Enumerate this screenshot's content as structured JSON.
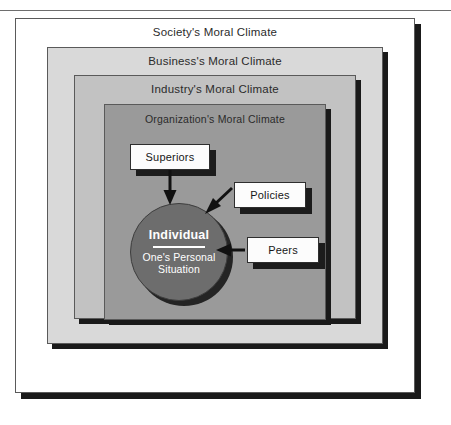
{
  "figure": {
    "layers": [
      {
        "key": "society",
        "label": "Society's Moral Climate",
        "fill": "#ffffff"
      },
      {
        "key": "business",
        "label": "Business's Moral Climate",
        "fill": "#d9d9d9"
      },
      {
        "key": "industry",
        "label": "Industry's Moral Climate",
        "fill": "#c2c2c2"
      },
      {
        "key": "organization",
        "label": "Organization's Moral Climate",
        "fill": "#9a9a9a"
      }
    ],
    "center": {
      "title": "Individual",
      "subtitle_line1": "One's Personal",
      "subtitle_line2": "Situation",
      "fill": "#6d6d6d",
      "text_color": "#ffffff"
    },
    "influences": [
      {
        "key": "superiors",
        "label": "Superiors",
        "arrow": "down-into-circle"
      },
      {
        "key": "policies",
        "label": "Policies",
        "arrow": "diagonal-down-left-into-circle"
      },
      {
        "key": "peers",
        "label": "Peers",
        "arrow": "left-into-circle"
      }
    ],
    "colors": {
      "frame_border": "#5a5a5a",
      "shadow": "#1a1a1a",
      "arrow": "#111111",
      "box_fill": "#fcfcfc",
      "box_border": "#2e2e2e"
    }
  }
}
